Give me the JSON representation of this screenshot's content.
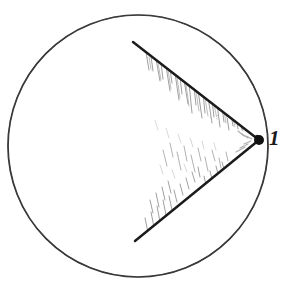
{
  "figure": {
    "type": "geometry-diagram",
    "background_color": "#ffffff",
    "ink_color": "#1a1a1a",
    "hatch_color": "#7a7a7a",
    "circle": {
      "name": "main-circle",
      "center_x": 138,
      "center_y": 146,
      "radius": 130,
      "stroke_width": 1.7
    },
    "vertex": {
      "name": "inscribed-angle-vertex",
      "label": "1",
      "x": 259,
      "y": 140,
      "dot_radius": 5
    },
    "chords": [
      {
        "name": "upper-chord",
        "from_x": 259,
        "from_y": 140,
        "to_x": 133,
        "to_y": 42,
        "stroke_width": 2.4
      },
      {
        "name": "lower-chord",
        "from_x": 259,
        "from_y": 140,
        "to_x": 135,
        "to_y": 241,
        "stroke_width": 2.4
      }
    ],
    "hatching": {
      "name": "sector-hatching",
      "style": "short-steep-pencil-strokes",
      "stroke_color": "#8a8a8a",
      "stroke_width": 0.9
    }
  },
  "labels": {
    "vertex_label": "1"
  }
}
